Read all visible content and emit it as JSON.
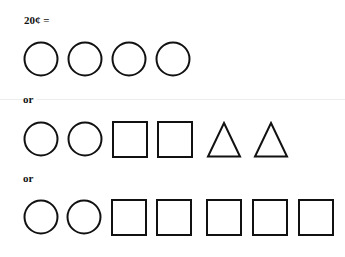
{
  "title": "20¢ =",
  "separators": [
    "or",
    "or"
  ],
  "rows": [
    {
      "top": 41,
      "shapes": [
        {
          "type": "circle",
          "x": 23
        },
        {
          "type": "circle",
          "x": 67
        },
        {
          "type": "circle",
          "x": 111
        },
        {
          "type": "circle",
          "x": 155
        }
      ]
    },
    {
      "top": 121,
      "shapes": [
        {
          "type": "circle",
          "x": 23
        },
        {
          "type": "circle",
          "x": 67
        },
        {
          "type": "square",
          "x": 112
        },
        {
          "type": "square",
          "x": 157
        },
        {
          "type": "triangle",
          "x": 206
        },
        {
          "type": "triangle",
          "x": 253
        }
      ]
    },
    {
      "top": 199,
      "shapes": [
        {
          "type": "circle",
          "x": 23
        },
        {
          "type": "circle",
          "x": 66
        },
        {
          "type": "square",
          "x": 111
        },
        {
          "type": "square",
          "x": 156
        },
        {
          "type": "square",
          "x": 206
        },
        {
          "type": "square",
          "x": 252
        },
        {
          "type": "square",
          "x": 298
        }
      ]
    }
  ],
  "colors": {
    "stroke": "#111111",
    "background": "#ffffff",
    "rule": "#ececec"
  }
}
